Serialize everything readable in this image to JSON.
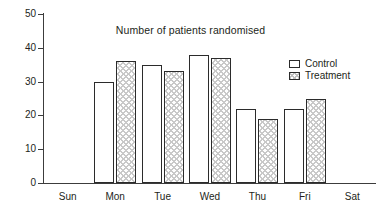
{
  "chart_data": {
    "type": "bar",
    "title": "Number of patients randomised",
    "subtitle": "",
    "xlabel": "",
    "ylabel": "",
    "categories": [
      "Sun",
      "Mon",
      "Tue",
      "Wed",
      "Thu",
      "Fri",
      "Sat"
    ],
    "series": [
      {
        "name": "Control",
        "values": [
          0,
          30,
          35,
          38,
          22,
          22,
          0
        ]
      },
      {
        "name": "Treatment",
        "values": [
          0,
          36,
          33,
          37,
          19,
          25,
          0
        ]
      }
    ],
    "ylim": [
      0,
      50
    ],
    "yticks": [
      0,
      10,
      20,
      30,
      40,
      50
    ],
    "ytick_labels": [
      "0",
      "10",
      "20",
      "30",
      "40",
      "50"
    ],
    "grid": false,
    "legend_position": "top-right",
    "legend": [
      {
        "label": "Control",
        "swatch": "white-outline"
      },
      {
        "label": "Treatment",
        "swatch": "cross-hatched"
      }
    ],
    "colors": {
      "axis": "#3c3c3c",
      "text": "#231f20",
      "bar_outline": "#2b2b2b",
      "control_fill": "#ffffff",
      "treatment_hatch": "#c9c9c9",
      "background": "#ffffff"
    }
  }
}
